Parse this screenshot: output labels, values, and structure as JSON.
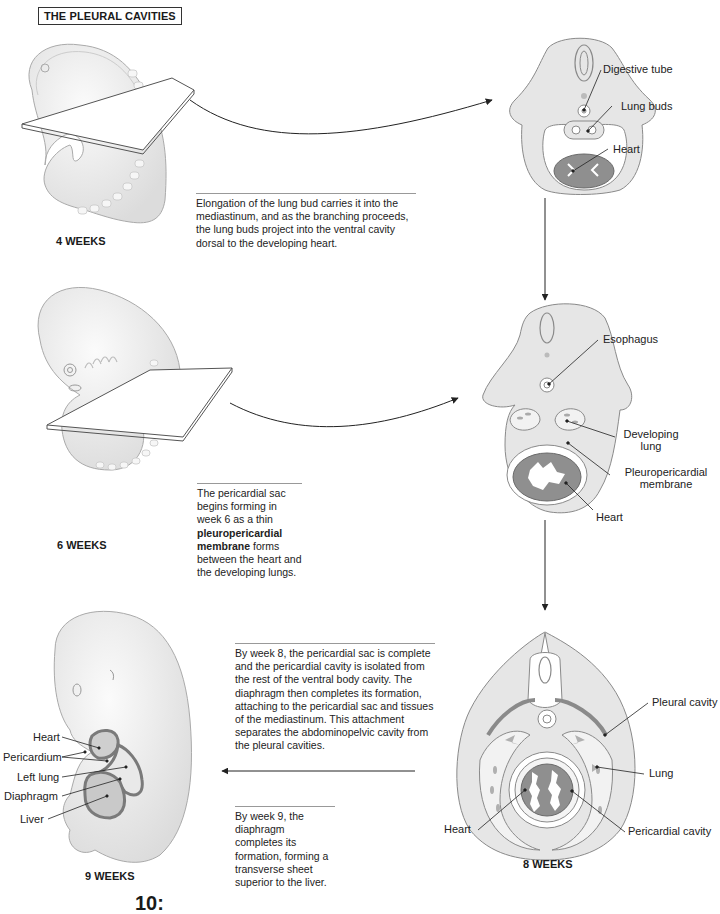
{
  "figure": {
    "title": "THE PLEURAL CAVITIES",
    "page_number_fragment": "10:"
  },
  "stages": [
    {
      "id": "week4",
      "label": "4 WEEKS",
      "caption": "Elongation of the lung bud carries it into the mediastinum, and as the branching proceeds, the lung buds project into the ventral cavity dorsal to the developing heart.",
      "section_labels": [
        "Digestive tube",
        "Lung buds",
        "Heart"
      ]
    },
    {
      "id": "week6",
      "label": "6 WEEKS",
      "caption_parts": {
        "before": "The pericardial sac begins forming in week 6 as a thin ",
        "bold": "pleuropericardial membrane",
        "after": " forms between the heart and the developing lungs."
      },
      "section_labels": [
        "Esophagus",
        "Developing lung",
        "Pleuropericardial membrane",
        "Heart"
      ],
      "developing_lung_lines": [
        "Developing",
        "lung"
      ],
      "membrane_lines": [
        "Pleuropericardial",
        "membrane"
      ]
    },
    {
      "id": "week8",
      "label": "8 WEEKS",
      "caption": "By week 8, the pericardial sac is complete and the pericardial cavity is isolated from the rest of the ventral body cavity. The diaphragm then completes its formation, attaching to the pericardial sac and tissues of the mediastinum. This attachment separates the abdominopelvic cavity from the pleural cavities.",
      "section_labels": [
        "Pleural cavity",
        "Lung",
        "Heart",
        "Pericardial cavity"
      ]
    },
    {
      "id": "week9",
      "label": "9 WEEKS",
      "caption": "By week 9, the diaphragm completes its formation, forming a transverse sheet superior to the liver.",
      "embryo_labels": [
        "Heart",
        "Pericardium",
        "Left lung",
        "Diaphragm",
        "Liver"
      ]
    }
  ],
  "colors": {
    "tissue_fill": "#e6e6e6",
    "tissue_outline": "#8a8a8a",
    "heart_fill": "#8f8f8f",
    "embryo_fill": "#f2f2f2",
    "leader_line": "#222222"
  }
}
